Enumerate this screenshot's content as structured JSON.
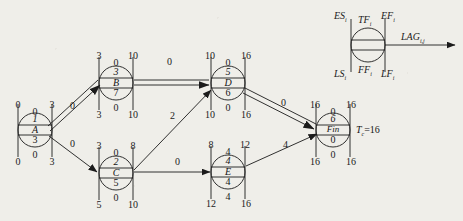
{
  "diagram": {
    "project_duration_label": "T",
    "project_duration_sub": "c",
    "project_duration_value": "=16",
    "nodes": [
      {
        "id": "A",
        "key": "A",
        "cx": 35,
        "cy": 130,
        "top_mid": "1",
        "label": "A",
        "bottom_mid": "3",
        "tl": "0",
        "tm": "0",
        "tr": "3",
        "bl": "0",
        "bm": "0",
        "br": "3"
      },
      {
        "id": "B",
        "key": "B",
        "cx": 116,
        "cy": 83,
        "top_mid": "3",
        "label": "B",
        "bottom_mid": "7",
        "tl": "3",
        "tm": "0",
        "tr": "10",
        "bl": "3",
        "bm": "0",
        "br": "10"
      },
      {
        "id": "C",
        "key": "C",
        "cx": 116,
        "cy": 173,
        "top_mid": "2",
        "label": "C",
        "bottom_mid": "5",
        "tl": "3",
        "tm": "0",
        "tr": "8",
        "bl": "5",
        "bm": "0",
        "br": "10"
      },
      {
        "id": "D",
        "key": "D",
        "cx": 228,
        "cy": 83,
        "top_mid": "5",
        "label": "D",
        "bottom_mid": "6",
        "tl": "10",
        "tm": "0",
        "tr": "16",
        "bl": "10",
        "bm": "0",
        "br": "16"
      },
      {
        "id": "E",
        "key": "E",
        "cx": 228,
        "cy": 172,
        "top_mid": "4",
        "label": "E",
        "bottom_mid": "4",
        "tl": "8",
        "tm": "4",
        "tr": "12",
        "bl": "12",
        "bm": "4",
        "br": "16"
      },
      {
        "id": "Fin",
        "key": "Fin",
        "cx": 333,
        "cy": 130,
        "top_mid": "6",
        "label": "Fin",
        "bottom_mid": "0",
        "tl": "16",
        "tm": "0",
        "tr": "16",
        "bl": "16",
        "bm": "0",
        "br": "16"
      }
    ],
    "edges": [
      {
        "from": "A",
        "to": "B",
        "lag": "0",
        "critical": true,
        "lx": 73,
        "ly": 106
      },
      {
        "from": "A",
        "to": "C",
        "lag": "0",
        "critical": false,
        "lx": 73,
        "ly": 143
      },
      {
        "from": "B",
        "to": "D",
        "lag": "0",
        "critical": true,
        "lx": 171,
        "ly": 62
      },
      {
        "from": "C",
        "to": "D",
        "lag": "2",
        "critical": false,
        "lx": 173,
        "ly": 117
      },
      {
        "from": "C",
        "to": "E",
        "lag": "0",
        "critical": false,
        "lx": 178,
        "ly": 158
      },
      {
        "from": "D",
        "to": "Fin",
        "lag": "0",
        "critical": true,
        "lx": 283,
        "ly": 105
      },
      {
        "from": "E",
        "to": "Fin",
        "lag": "4",
        "critical": false,
        "lx": 288,
        "ly": 143
      }
    ],
    "legend": {
      "es": "ES",
      "es_sub": "i",
      "tf": "TF",
      "tf_sub": "i",
      "ef": "EF",
      "ef_sub": "i",
      "ls": "LS",
      "ls_sub": "i",
      "ff": "FF",
      "ff_sub": "i",
      "lf": "LF",
      "lf_sub": "i",
      "lag": "LAG",
      "lag_sub": "i,j"
    }
  }
}
